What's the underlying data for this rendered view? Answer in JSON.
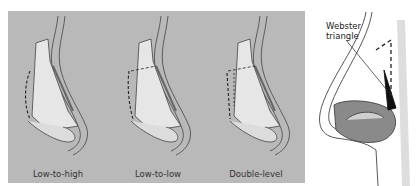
{
  "figure": {
    "panels": [
      {
        "id": "low-to-high",
        "label": "Low-to-high"
      },
      {
        "id": "low-to-low",
        "label": "Low-to-low"
      },
      {
        "id": "double-level",
        "label": "Double-level"
      }
    ],
    "annotation": {
      "line1": "Webster",
      "line2": "triangle"
    },
    "colors": {
      "panel_bg": "#b9b9b9",
      "bone": "#e8e8e8",
      "line": "#333333",
      "triangle": "#111111"
    }
  }
}
